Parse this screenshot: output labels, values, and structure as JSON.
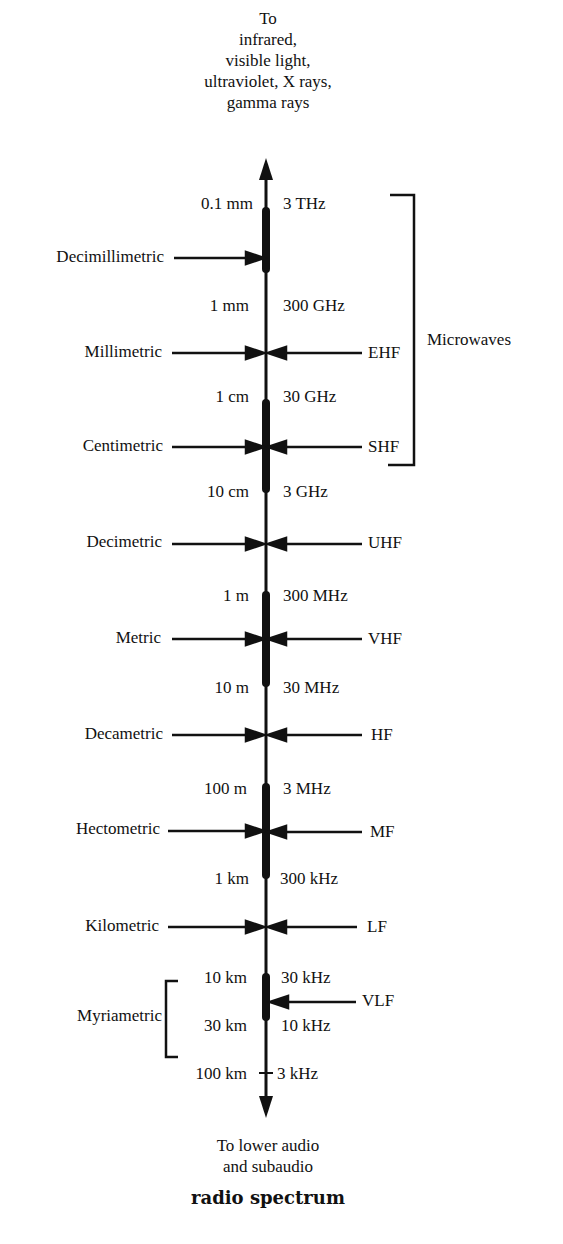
{
  "top_note": [
    "To",
    "infrared,",
    "visible light,",
    "ultraviolet, X rays,",
    "gamma rays"
  ],
  "bottom_note": [
    "To lower audio",
    "and subaudio"
  ],
  "title": "radio spectrum",
  "group_label": "Microwaves",
  "myriametric_label": "Myriametric",
  "boundaries": [
    {
      "wavelength": "0.1 mm",
      "frequency": "3 THz"
    },
    {
      "wavelength": "1 mm",
      "frequency": "300 GHz"
    },
    {
      "wavelength": "1 cm",
      "frequency": "30 GHz"
    },
    {
      "wavelength": "10 cm",
      "frequency": "3 GHz"
    },
    {
      "wavelength": "1 m",
      "frequency": "300 MHz"
    },
    {
      "wavelength": "10 m",
      "frequency": "30 MHz"
    },
    {
      "wavelength": "100 m",
      "frequency": "3 MHz"
    },
    {
      "wavelength": "1 km",
      "frequency": "300 kHz"
    },
    {
      "wavelength": "10 km",
      "frequency": "30 kHz"
    },
    {
      "wavelength": "30 km",
      "frequency": "10 kHz"
    },
    {
      "wavelength": "100 km",
      "frequency": "3 kHz"
    }
  ],
  "bands": [
    {
      "metric_name": "Decimillimetric",
      "designation": ""
    },
    {
      "metric_name": "Millimetric",
      "designation": "EHF"
    },
    {
      "metric_name": "Centimetric",
      "designation": "SHF"
    },
    {
      "metric_name": "Decimetric",
      "designation": "UHF"
    },
    {
      "metric_name": "Metric",
      "designation": "VHF"
    },
    {
      "metric_name": "Decametric",
      "designation": "HF"
    },
    {
      "metric_name": "Hectometric",
      "designation": "MF"
    },
    {
      "metric_name": "Kilometric",
      "designation": "LF"
    },
    {
      "metric_name": "",
      "designation": "VLF"
    }
  ]
}
